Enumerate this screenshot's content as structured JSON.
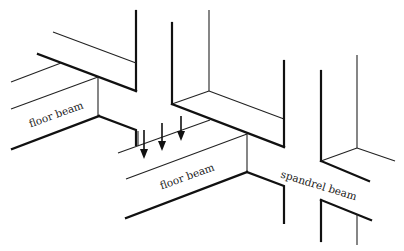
{
  "diagram": {
    "title": "",
    "labels": {
      "floor_beam_left": "floor beam",
      "floor_beam_center": "floor beam",
      "spandrel_beam": "spandrel beam"
    },
    "elements": [
      {
        "name": "left-floor-beam",
        "label": "floor beam"
      },
      {
        "name": "center-floor-beam",
        "label": "floor beam"
      },
      {
        "name": "spandrel-beam",
        "label": "spandrel beam"
      },
      {
        "name": "load-arrows",
        "count": 3,
        "direction": "down"
      },
      {
        "name": "columns",
        "count": 4
      }
    ],
    "colors": {
      "line": "#111111",
      "background": "#ffffff"
    }
  }
}
